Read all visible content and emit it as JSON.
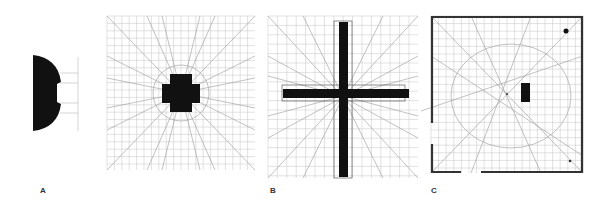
{
  "figure": {
    "labels": [
      "A",
      "B",
      "C"
    ],
    "panels": [
      {
        "id": "A-shape",
        "description": "Half-disc shape with notch and guide lines"
      },
      {
        "id": "A-grid",
        "description": "Construction grid with central cross (plus) shape and circle"
      },
      {
        "id": "B",
        "description": "Construction grid with large Latin cross"
      },
      {
        "id": "C",
        "description": "Plan with thick walls, grid, central black rectangle and point markers"
      }
    ],
    "colors": {
      "ink": "#111111",
      "grid": "#bbbbbb",
      "wall": "#333333"
    }
  }
}
